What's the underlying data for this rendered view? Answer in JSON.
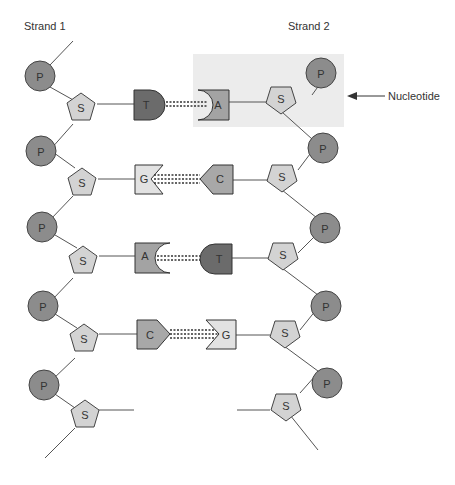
{
  "labels": {
    "strand1": "Strand 1",
    "strand2": "Strand 2",
    "nucleotide": "Nucleotide"
  },
  "glyphs": {
    "phosphate": "P",
    "sugar": "S"
  },
  "base_pairs": [
    {
      "left": "T",
      "right": "A"
    },
    {
      "left": "G",
      "right": "C"
    },
    {
      "left": "A",
      "right": "T"
    },
    {
      "left": "C",
      "right": "G"
    }
  ],
  "colors": {
    "phosphate": "#8c8c8c",
    "sugar": "#d3d3d3",
    "T": "#6b6b6b",
    "A": "#a3a3a3",
    "G": "#e2e2e2",
    "C": "#a8a8a8",
    "highlight": "#ececec",
    "stroke": "#444444"
  }
}
